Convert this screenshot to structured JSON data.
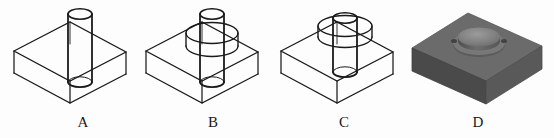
{
  "document": {
    "title": "Multiple-choice figure set: block with cylindrical hole / boss",
    "background_color": "#fdfdfd",
    "line_color": "#1a1a1a",
    "width": 554,
    "height": 138
  },
  "figures": [
    {
      "id": "A",
      "label": "A",
      "label_x": 83,
      "label_y": 117,
      "style": "wireframe",
      "description": "Transparent rectangular block in isometric view with a plain straight cylinder passing vertically through it; cylinder extends above and below the block.",
      "has_collar": false,
      "collar_position": "none",
      "cylinder_length": "long",
      "offset_x": 8
    },
    {
      "id": "B",
      "label": "B",
      "label_x": 213,
      "label_y": 117,
      "style": "wireframe",
      "description": "Transparent rectangular block with a vertical cylinder through it plus a wide cylindrical collar/flange encircling the shaft above the top face.",
      "has_collar": true,
      "collar_position": "above-top-face",
      "cylinder_length": "long",
      "offset_x": 140
    },
    {
      "id": "C",
      "label": "C",
      "label_x": 344,
      "label_y": 117,
      "style": "wireframe",
      "description": "Transparent rectangular block with a shorter vertical cylinder and a wide cylindrical collar resting at the top face; shaft ends inside the block.",
      "has_collar": true,
      "collar_position": "at-top-face",
      "cylinder_length": "short",
      "offset_x": 275
    },
    {
      "id": "D",
      "label": "D",
      "label_x": 478,
      "label_y": 117,
      "style": "shaded-solid",
      "description": "Opaque grey shaded rectangular block with a raised circular boss (short cylinder) on its top face.",
      "has_collar": false,
      "collar_position": "none",
      "cylinder_length": "boss",
      "offset_x": 408,
      "shading": {
        "top_face": "#6f6f6f",
        "front_face": "#4a4a4a",
        "side_face": "#585858",
        "boss_top": "#8a8a8a",
        "boss_side": "#5e5e5e",
        "boss_shadow": "#3e3e3e"
      }
    }
  ]
}
